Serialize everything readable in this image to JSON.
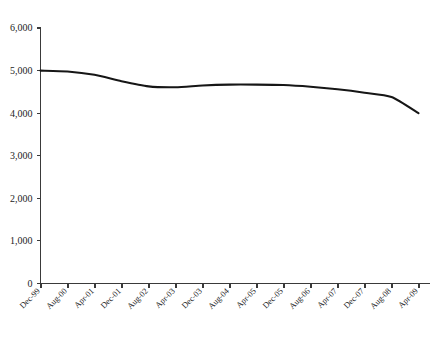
{
  "chart_data": {
    "type": "line",
    "title": "",
    "title_note": "chart title is cropped off the top edge of the screenshot; only faint bottom strokes of the glyphs and a closing parenthesis are visible",
    "xlabel": "",
    "ylabel": "",
    "ylim": [
      0,
      6000
    ],
    "yticks": [
      0,
      1000,
      2000,
      3000,
      4000,
      5000,
      6000
    ],
    "ytick_labels": [
      "0",
      "1,000",
      "2,000",
      "3,000",
      "4,000",
      "5,000",
      "6,000"
    ],
    "grid": false,
    "legend": "none",
    "categories": [
      "Dec-99",
      "Aug-00",
      "Apr-01",
      "Dec-01",
      "Aug-02",
      "Apr-03",
      "Dec-03",
      "Aug-04",
      "Apr-05",
      "Dec-05",
      "Aug-06",
      "Apr-07",
      "Dec-07",
      "Aug-08",
      "Apr-09"
    ],
    "xtick_interval_months": 4,
    "series": [
      {
        "name": "series-1",
        "color": "#161616",
        "values": [
          5000,
          4980,
          4900,
          4750,
          4630,
          4610,
          4650,
          4670,
          4670,
          4660,
          4620,
          4560,
          4480,
          4380,
          4000
        ]
      }
    ],
    "value_range": {
      "min": 4000,
      "max": 5000
    },
    "annotations": []
  },
  "axes": {
    "y_axis_name": "value-axis",
    "x_axis_name": "time-axis"
  }
}
